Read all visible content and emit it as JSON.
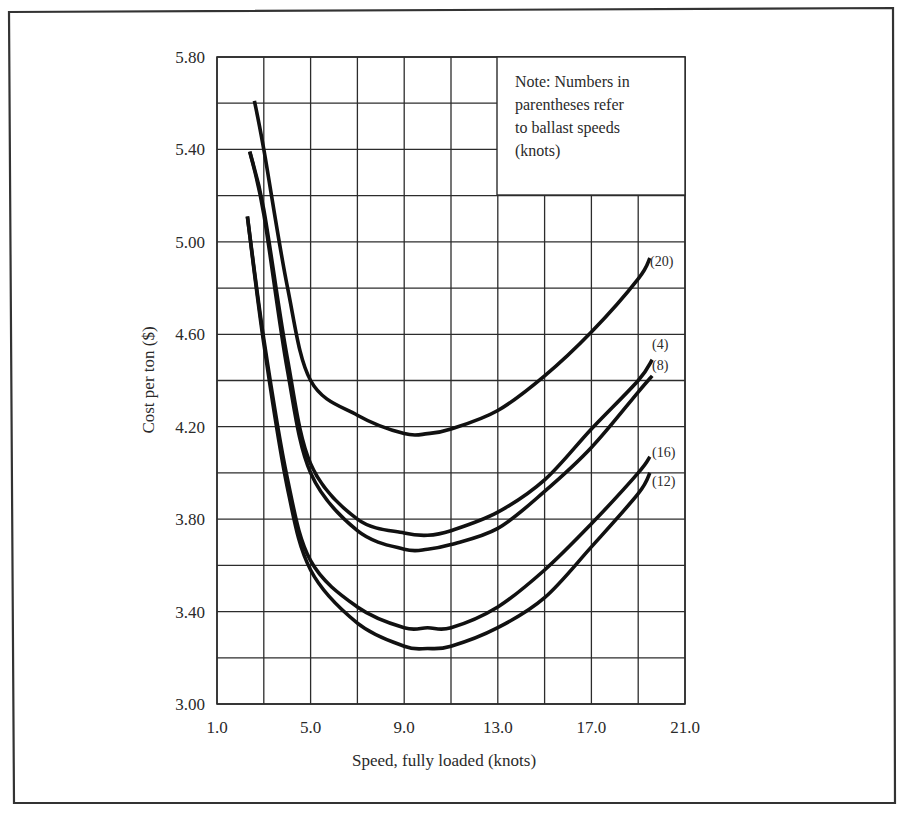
{
  "chart_data": {
    "type": "line",
    "title": "",
    "xlabel": "Speed, fully loaded (knots)",
    "ylabel": "Cost per ton ($)",
    "xlim": [
      1.0,
      21.0
    ],
    "ylim": [
      3.0,
      5.8
    ],
    "x_ticks": [
      "1.0",
      "5.0",
      "9.0",
      "13.0",
      "17.0",
      "21.0"
    ],
    "x_tick_values": [
      1.0,
      5.0,
      9.0,
      13.0,
      17.0,
      21.0
    ],
    "y_ticks": [
      "3.00",
      "3.40",
      "3.80",
      "4.20",
      "4.60",
      "5.00",
      "5.40",
      "5.80"
    ],
    "y_tick_values": [
      3.0,
      3.4,
      3.8,
      4.2,
      4.6,
      5.0,
      5.4,
      5.8
    ],
    "grid": {
      "on": true,
      "x_step": 2.0,
      "y_step": 0.2
    },
    "note": [
      "Note: Numbers in",
      "parentheses refer",
      "to ballast speeds",
      "(knots)"
    ],
    "legend_position": "inline labels at right end of each curve",
    "series": [
      {
        "name": "(20)",
        "ballast_speed_knots": 20,
        "x": [
          2.6,
          3.0,
          4.0,
          5.0,
          7.0,
          9.0,
          10.0,
          11.0,
          13.0,
          15.0,
          17.0,
          19.0,
          19.5
        ],
        "y": [
          5.61,
          5.4,
          4.81,
          4.4,
          4.25,
          4.17,
          4.17,
          4.19,
          4.27,
          4.42,
          4.61,
          4.84,
          4.93
        ]
      },
      {
        "name": "(4)",
        "ballast_speed_knots": 4,
        "x": [
          2.4,
          3.0,
          4.0,
          5.0,
          7.0,
          9.0,
          10.0,
          11.0,
          13.0,
          15.0,
          17.0,
          19.0,
          19.6
        ],
        "y": [
          5.39,
          5.14,
          4.5,
          4.04,
          3.8,
          3.74,
          3.73,
          3.75,
          3.83,
          3.97,
          4.19,
          4.4,
          4.49
        ]
      },
      {
        "name": "(8)",
        "ballast_speed_knots": 8,
        "x": [
          2.4,
          3.0,
          4.0,
          5.0,
          7.0,
          9.0,
          10.0,
          11.0,
          13.0,
          15.0,
          17.0,
          19.0,
          19.6
        ],
        "y": [
          5.39,
          5.12,
          4.45,
          4.0,
          3.75,
          3.67,
          3.67,
          3.69,
          3.76,
          3.92,
          4.11,
          4.35,
          4.42
        ]
      },
      {
        "name": "(16)",
        "ballast_speed_knots": 16,
        "x": [
          2.3,
          3.0,
          4.0,
          5.0,
          7.0,
          9.0,
          10.0,
          11.0,
          13.0,
          15.0,
          17.0,
          19.0,
          19.5
        ],
        "y": [
          5.11,
          4.58,
          3.98,
          3.62,
          3.42,
          3.33,
          3.33,
          3.33,
          3.42,
          3.58,
          3.78,
          4.0,
          4.07
        ]
      },
      {
        "name": "(12)",
        "ballast_speed_knots": 12,
        "x": [
          2.3,
          3.0,
          4.0,
          5.0,
          7.0,
          9.0,
          10.0,
          11.0,
          13.0,
          15.0,
          17.0,
          19.0,
          19.5
        ],
        "y": [
          5.11,
          4.56,
          3.94,
          3.58,
          3.35,
          3.25,
          3.24,
          3.25,
          3.33,
          3.46,
          3.68,
          3.91,
          4.0
        ]
      }
    ]
  },
  "labels": {
    "xlabel": "Speed, fully loaded (knots)",
    "ylabel": "Cost per ton ($)"
  },
  "colors": {
    "curve": "#111111",
    "grid": "#2c2c2c",
    "frame": "#333333",
    "background": "#ffffff"
  }
}
